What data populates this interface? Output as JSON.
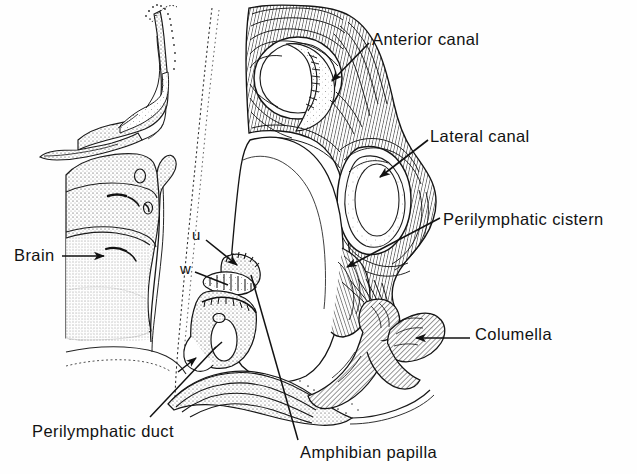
{
  "figure": {
    "background_color": "#fefefe",
    "ink_color": "#121212",
    "width": 637,
    "height": 474
  },
  "labels": {
    "anterior_canal": "Anterior canal",
    "lateral_canal": "Lateral canal",
    "perilymphatic_cistern": "Perilymphatic cistern",
    "columella": "Columella",
    "amphibian_papilla": "Amphibian papilla",
    "perilymphatic_duct": "Perilymphatic duct",
    "brain": "Brain",
    "marker_u": "u",
    "marker_w": "w"
  },
  "leaders": [
    {
      "name": "anterior-canal-leader",
      "type": "arrow",
      "from": [
        369,
        43
      ],
      "to": [
        330,
        82
      ]
    },
    {
      "name": "lateral-canal-leader",
      "type": "arrow",
      "from": [
        428,
        140
      ],
      "to": [
        378,
        178
      ]
    },
    {
      "name": "perilymphatic-cistern-leader",
      "type": "arrow",
      "from": [
        440,
        218
      ],
      "to": [
        345,
        268
      ]
    },
    {
      "name": "columella-leader",
      "type": "arrow",
      "from": [
        470,
        338
      ],
      "to": [
        414,
        338
      ]
    },
    {
      "name": "amphibian-papilla-leader",
      "type": "line",
      "from": [
        298,
        440
      ],
      "to": [
        252,
        276
      ]
    },
    {
      "name": "perilymphatic-duct-leader",
      "type": "line",
      "from": [
        148,
        418
      ],
      "to": [
        215,
        348
      ]
    },
    {
      "name": "brain-leader",
      "type": "arrow",
      "from": [
        62,
        256
      ],
      "to": [
        106,
        256
      ]
    },
    {
      "name": "marker-u-leader",
      "type": "arrow",
      "from": [
        206,
        240
      ],
      "to": [
        238,
        266
      ]
    },
    {
      "name": "marker-w-leader",
      "type": "line",
      "from": [
        196,
        272
      ],
      "to": [
        226,
        284
      ]
    }
  ],
  "structures": [
    {
      "name": "skull-bone-fragment",
      "region": "upper-left",
      "texture": "stippled-outline"
    },
    {
      "name": "brain-mass",
      "region": "left",
      "texture": "dense-stipple"
    },
    {
      "name": "otic-capsule",
      "region": "center-right",
      "texture": "hatched"
    },
    {
      "name": "anterior-canal-lumen",
      "region": "upper-center",
      "texture": "open"
    },
    {
      "name": "lateral-canal-lumen",
      "region": "mid-right",
      "texture": "open"
    },
    {
      "name": "perilymphatic-cistern",
      "region": "center",
      "texture": "open"
    },
    {
      "name": "columella-bone",
      "region": "lower-right",
      "texture": "hatched"
    },
    {
      "name": "amphibian-papilla",
      "region": "center-lower",
      "texture": "stippled"
    },
    {
      "name": "perilymphatic-duct",
      "region": "lower-left",
      "texture": "layered-hatch"
    }
  ]
}
